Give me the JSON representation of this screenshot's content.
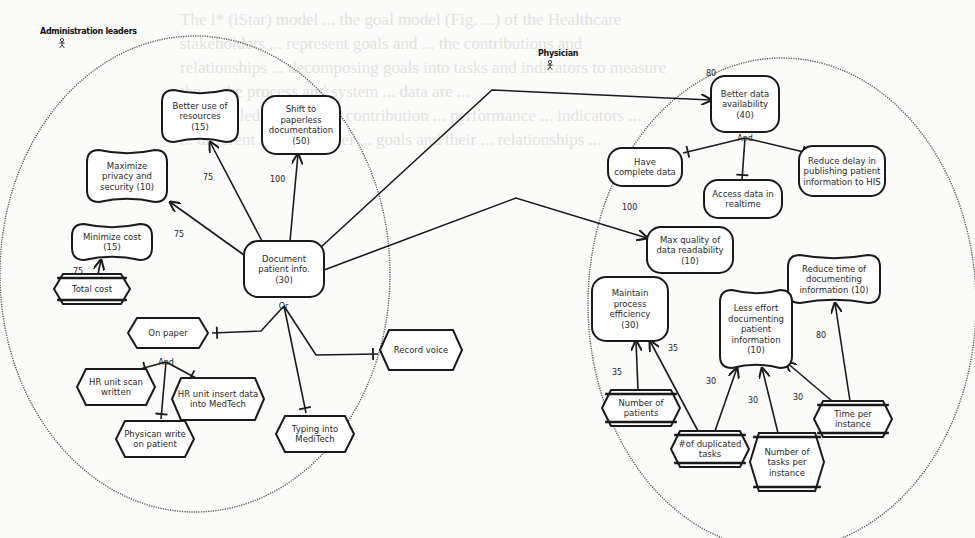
{
  "actors": [
    {
      "id": "admin",
      "label": "Administration leaders",
      "x": 40,
      "y": 34,
      "icon": "person-icon",
      "boundary": {
        "cx": 195,
        "cy": 274,
        "rx": 195,
        "ry": 238
      }
    },
    {
      "id": "physician",
      "label": "Physician",
      "x": 538,
      "y": 56,
      "icon": "person-icon",
      "boundary": {
        "cx": 782,
        "cy": 304,
        "rx": 194,
        "ry": 246
      }
    }
  ],
  "nodes": [
    {
      "id": "better-resources",
      "type": "softgoal",
      "lines": [
        "Better use of",
        "resources",
        "(15)"
      ],
      "x": 162,
      "y": 90,
      "w": 76,
      "h": 52
    },
    {
      "id": "paperless",
      "type": "goal",
      "lines": [
        "Shift to",
        "paperless",
        "documentation",
        "(50)"
      ],
      "x": 262,
      "y": 96,
      "w": 78,
      "h": 58
    },
    {
      "id": "privacy",
      "type": "softgoal",
      "lines": [
        "Maximize",
        "privacy and",
        "security  (10)"
      ],
      "x": 87,
      "y": 150,
      "w": 80,
      "h": 52
    },
    {
      "id": "min-cost",
      "type": "softgoal",
      "lines": [
        "Minimize cost",
        "(15)"
      ],
      "x": 72,
      "y": 224,
      "w": 80,
      "h": 36
    },
    {
      "id": "doc-patient",
      "type": "goal",
      "lines": [
        "Document",
        "patient info.",
        "(30)"
      ],
      "x": 244,
      "y": 241,
      "w": 80,
      "h": 56
    },
    {
      "id": "total-cost",
      "type": "indicator",
      "lines": [
        "Total cost"
      ],
      "x": 54,
      "y": 274,
      "w": 76,
      "h": 30
    },
    {
      "id": "on-paper",
      "type": "task",
      "lines": [
        "On paper"
      ],
      "x": 128,
      "y": 318,
      "w": 80,
      "h": 30
    },
    {
      "id": "record-voice",
      "type": "task",
      "lines": [
        "Record voice"
      ],
      "x": 380,
      "y": 330,
      "w": 82,
      "h": 40
    },
    {
      "id": "hr-scan",
      "type": "task",
      "lines": [
        "HR unit scan",
        "written"
      ],
      "x": 77,
      "y": 369,
      "w": 78,
      "h": 36
    },
    {
      "id": "hr-insert",
      "type": "task",
      "lines": [
        "HR unit insert data",
        "into MedTech"
      ],
      "x": 172,
      "y": 378,
      "w": 92,
      "h": 42
    },
    {
      "id": "phys-write",
      "type": "task",
      "lines": [
        "Physican write",
        "on patient"
      ],
      "x": 116,
      "y": 421,
      "w": 78,
      "h": 36
    },
    {
      "id": "typing-meditech",
      "type": "task",
      "lines": [
        "Typing into",
        "MediTech"
      ],
      "x": 276,
      "y": 416,
      "w": 78,
      "h": 36
    },
    {
      "id": "better-data",
      "type": "goal",
      "lines": [
        "Better data",
        "availability",
        "(40)"
      ],
      "x": 711,
      "y": 76,
      "w": 68,
      "h": 56
    },
    {
      "id": "complete-data",
      "type": "goal",
      "lines": [
        "Have",
        "complete data"
      ],
      "x": 608,
      "y": 148,
      "w": 74,
      "h": 38
    },
    {
      "id": "reduce-delay",
      "type": "goal",
      "lines": [
        "Reduce delay in",
        "publishing patient",
        "information to HIS"
      ],
      "x": 799,
      "y": 146,
      "w": 86,
      "h": 50
    },
    {
      "id": "realtime",
      "type": "goal",
      "lines": [
        "Access data in",
        "realtime"
      ],
      "x": 704,
      "y": 180,
      "w": 78,
      "h": 38
    },
    {
      "id": "max-quality",
      "type": "goal",
      "lines": [
        "Max quality of",
        "data readability",
        "(10)"
      ],
      "x": 647,
      "y": 227,
      "w": 86,
      "h": 46
    },
    {
      "id": "reduce-time",
      "type": "softgoal",
      "lines": [
        "Reduce time of",
        "documenting",
        "information  (10)"
      ],
      "x": 788,
      "y": 255,
      "w": 92,
      "h": 48
    },
    {
      "id": "maintain-eff",
      "type": "goal",
      "lines": [
        "Maintain",
        "process",
        "efficiency",
        "(30)"
      ],
      "x": 592,
      "y": 277,
      "w": 76,
      "h": 64
    },
    {
      "id": "less-effort",
      "type": "softgoal",
      "lines": [
        "Less effort",
        "documenting",
        "patient",
        "information",
        "(10)"
      ],
      "x": 720,
      "y": 290,
      "w": 72,
      "h": 78
    },
    {
      "id": "num-patients",
      "type": "indicator",
      "lines": [
        "Number of",
        "patients"
      ],
      "x": 602,
      "y": 390,
      "w": 78,
      "h": 36
    },
    {
      "id": "dup-tasks",
      "type": "indicator",
      "lines": [
        "#of duplicated",
        "tasks"
      ],
      "x": 671,
      "y": 431,
      "w": 78,
      "h": 36
    },
    {
      "id": "tasks-per-inst",
      "type": "indicator",
      "lines": [
        "Number of",
        "tasks per",
        "instance"
      ],
      "x": 750,
      "y": 433,
      "w": 74,
      "h": 58
    },
    {
      "id": "time-per-inst",
      "type": "indicator",
      "lines": [
        "Time per",
        "instance"
      ],
      "x": 814,
      "y": 401,
      "w": 78,
      "h": 36
    }
  ],
  "edges": [
    {
      "kind": "contribution",
      "weight": "75",
      "points": [
        [
          262,
          241
        ],
        [
          210,
          142
        ]
      ],
      "wx": 203,
      "wy": 180
    },
    {
      "kind": "contribution",
      "weight": "100",
      "points": [
        [
          290,
          241
        ],
        [
          298,
          154
        ]
      ],
      "wx": 270,
      "wy": 182
    },
    {
      "kind": "contribution",
      "weight": "75",
      "points": [
        [
          244,
          255
        ],
        [
          170,
          202
        ]
      ],
      "wx": 174,
      "wy": 237
    },
    {
      "kind": "contribution",
      "weight": "75",
      "points": [
        [
          98,
          274
        ],
        [
          101,
          260
        ]
      ],
      "wx": 73,
      "wy": 274
    },
    {
      "kind": "contribution",
      "weight": "80",
      "points": [
        [
          320,
          248
        ],
        [
          492,
          90
        ],
        [
          711,
          100
        ]
      ],
      "wx": 706,
      "wy": 76
    },
    {
      "kind": "contribution",
      "weight": "100",
      "points": [
        [
          324,
          270
        ],
        [
          516,
          198
        ],
        [
          647,
          238
        ]
      ],
      "wx": 622,
      "wy": 210
    },
    {
      "kind": "contribution",
      "weight": "35",
      "points": [
        [
          638,
          390
        ],
        [
          636,
          341
        ]
      ],
      "wx": 612,
      "wy": 375
    },
    {
      "kind": "contribution",
      "weight": "35",
      "points": [
        [
          698,
          431
        ],
        [
          650,
          341
        ]
      ],
      "wx": 668,
      "wy": 351
    },
    {
      "kind": "contribution",
      "weight": "30",
      "points": [
        [
          715,
          431
        ],
        [
          737,
          368
        ]
      ],
      "wx": 706,
      "wy": 384
    },
    {
      "kind": "contribution",
      "weight": "30",
      "points": [
        [
          778,
          433
        ],
        [
          762,
          368
        ]
      ],
      "wx": 748,
      "wy": 403
    },
    {
      "kind": "contribution",
      "weight": "30",
      "points": [
        [
          832,
          401
        ],
        [
          786,
          362
        ]
      ],
      "wx": 793,
      "wy": 400
    },
    {
      "kind": "contribution",
      "weight": "80",
      "points": [
        [
          850,
          401
        ],
        [
          835,
          303
        ]
      ],
      "wx": 816,
      "wy": 338
    }
  ],
  "decompositions": [
    {
      "label": "Or",
      "x": 284,
      "y": 306,
      "branches": [
        {
          "points": [
            [
              284,
              306
            ],
            [
              261,
              331
            ],
            [
              212,
              333
            ]
          ],
          "to": "on-paper"
        },
        {
          "points": [
            [
              284,
              306
            ],
            [
              316,
              355
            ],
            [
              378,
              354
            ]
          ],
          "to": "record-voice"
        },
        {
          "points": [
            [
              284,
              306
            ],
            [
              306,
              413
            ]
          ],
          "to": "typing-meditech"
        }
      ]
    },
    {
      "label": "And",
      "x": 166,
      "y": 362,
      "branches": [
        {
          "points": [
            [
              166,
              362
            ],
            [
              140,
              369
            ]
          ],
          "to": "hr-scan"
        },
        {
          "points": [
            [
              166,
              362
            ],
            [
              196,
              378
            ]
          ],
          "to": "hr-insert"
        },
        {
          "points": [
            [
              166,
              362
            ],
            [
              161,
              419
            ]
          ],
          "to": "phys-write"
        }
      ]
    },
    {
      "label": "And",
      "x": 745,
      "y": 138,
      "branches": [
        {
          "points": [
            [
              745,
              138
            ],
            [
              683,
              153
            ]
          ],
          "to": "complete-data"
        },
        {
          "points": [
            [
              745,
              138
            ],
            [
              808,
              153
            ]
          ],
          "to": "reduce-delay"
        },
        {
          "points": [
            [
              745,
              138
            ],
            [
              742,
              180
            ]
          ],
          "to": "realtime"
        }
      ]
    }
  ],
  "background_bleed": "The i* (iStar) model ... the goal model (Fig. ...) of the Healthcare\nstakeholders ... represent goals and ... the contributions and\nrelationships ... decomposing goals into tasks and indicators to measure\nthe ... the process and system ... data are ...\n... modelled ... and their contribution ... performance ... indicators ...\n... different ... stakeholder ... goals and their ... relationships ..."
}
